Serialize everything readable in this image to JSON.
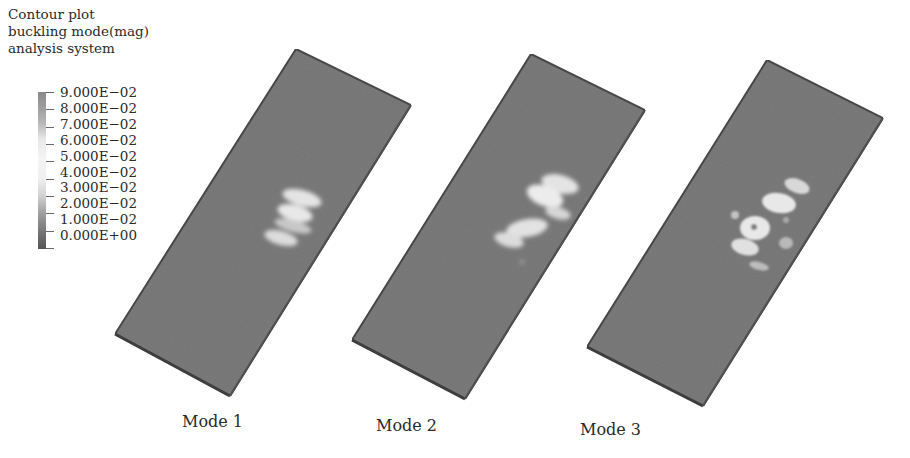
{
  "legend": {
    "title_lines": [
      "Contour plot",
      "buckling mode(mag)",
      "analysis system"
    ],
    "ticks": [
      "9.000E−02",
      "8.000E−02",
      "7.000E−02",
      "6.000E−02",
      "5.000E−02",
      "4.000E−02",
      "3.000E−02",
      "2.000E−02",
      "1.000E−02",
      "0.000E+00"
    ],
    "colors": [
      "#8a8a8a",
      "#a5a5a5",
      "#c8c8c8",
      "#ececec",
      "#f4f4f4",
      "#eeeeee",
      "#cfcfcf",
      "#9a9a9a",
      "#777777",
      "#555555"
    ]
  },
  "modes": [
    {
      "label": "Mode 1"
    },
    {
      "label": "Mode 2"
    },
    {
      "label": "Mode 3"
    }
  ],
  "colors": {
    "plate_fill": "#7b7b7b",
    "plate_edge": "#4a4a4a",
    "highlight": "#e6e6e6"
  }
}
